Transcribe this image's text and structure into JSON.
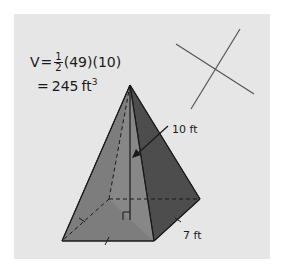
{
  "formula": {
    "lhs": "V",
    "equals": "=",
    "fraction_numerator": "1",
    "fraction_denominator": "2",
    "factor1": "(49)",
    "factor2": "(10)",
    "result_equals": "=",
    "result_value": "245",
    "result_unit": "ft",
    "result_exponent": "3"
  },
  "labels": {
    "height": "10 ft",
    "base_side": "7 ft"
  },
  "colors": {
    "panel": "#e6e6e6",
    "front_face": "#7d7d7d",
    "front_face_highlight": "#8f8f8f",
    "right_face": "#4d4d4d",
    "edge": "#1a1a1a",
    "cross_lines": "#555555"
  }
}
